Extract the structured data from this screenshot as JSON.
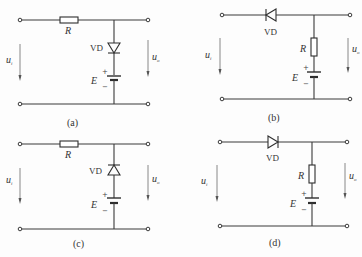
{
  "figure": {
    "circuits": [
      {
        "id": "a",
        "caption": "(a)",
        "resistor_label": "R",
        "diode_label": "VD",
        "source_label": "E",
        "plus": "+",
        "minus": "−",
        "input_label": "u",
        "input_sub": "i",
        "output_label": "u",
        "output_sub": "o",
        "topology": "series-resistor, shunt diode (anode up, cathode down) + battery",
        "diode_direction": "down"
      },
      {
        "id": "b",
        "caption": "(b)",
        "resistor_label": "R",
        "diode_label": "VD",
        "source_label": "E",
        "plus": "+",
        "minus": "−",
        "input_label": "u",
        "input_sub": "i",
        "output_label": "u",
        "output_sub": "o",
        "topology": "series diode, shunt resistor + battery",
        "diode_direction": "left"
      },
      {
        "id": "c",
        "caption": "(c)",
        "resistor_label": "R",
        "diode_label": "VD",
        "source_label": "E",
        "plus": "+",
        "minus": "−",
        "input_label": "u",
        "input_sub": "i",
        "output_label": "u",
        "output_sub": "o",
        "topology": "series-resistor, shunt diode (cathode up) + battery",
        "diode_direction": "up"
      },
      {
        "id": "d",
        "caption": "(d)",
        "resistor_label": "R",
        "diode_label": "VD",
        "source_label": "E",
        "plus": "+",
        "minus": "−",
        "input_label": "u",
        "input_sub": "i",
        "output_label": "u",
        "output_sub": "o",
        "topology": "series diode, shunt resistor + battery",
        "diode_direction": "right"
      }
    ]
  }
}
